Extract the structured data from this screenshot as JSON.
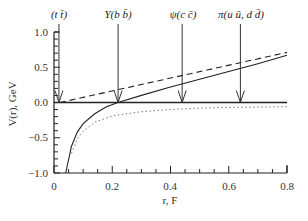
{
  "chart_data": {
    "type": "line",
    "title": "",
    "xlabel": "r, F",
    "ylabel": "V(r), GeV",
    "xlim": [
      0,
      0.8
    ],
    "ylim": [
      -1.0,
      1.0
    ],
    "x_ticks": [
      "0",
      "0.2",
      "0.4",
      "0.6",
      "0.8"
    ],
    "y_ticks": [
      "1.0",
      "0.5",
      "0.0",
      "−0.5",
      "−1.0"
    ],
    "grid": false,
    "legend": null,
    "series": [
      {
        "name": "total potential",
        "style": "solid",
        "x": [
          0.04,
          0.06,
          0.08,
          0.1,
          0.14,
          0.18,
          0.22,
          0.3,
          0.4,
          0.5,
          0.6,
          0.7,
          0.8
        ],
        "y": [
          -1.0,
          -0.62,
          -0.42,
          -0.3,
          -0.16,
          -0.06,
          0.0,
          0.1,
          0.22,
          0.33,
          0.44,
          0.55,
          0.67
        ]
      },
      {
        "name": "linear confining term",
        "style": "dashed",
        "x": [
          0.02,
          0.8
        ],
        "y": [
          0.0,
          0.71
        ]
      },
      {
        "name": "Coulomb-like term",
        "style": "dotted",
        "x": [
          0.06,
          0.08,
          0.1,
          0.14,
          0.2,
          0.3,
          0.4,
          0.5,
          0.6,
          0.7,
          0.8
        ],
        "y": [
          -0.72,
          -0.52,
          -0.41,
          -0.28,
          -0.19,
          -0.13,
          -0.1,
          -0.08,
          -0.07,
          -0.065,
          -0.06
        ]
      },
      {
        "name": "zero line",
        "style": "solid",
        "x": [
          0.0,
          0.8
        ],
        "y": [
          0.0,
          0.0
        ]
      }
    ],
    "annotations": [
      {
        "label": "(t t̄)",
        "x": 0.017,
        "y": 0.0
      },
      {
        "label": "Υ(b b̄)",
        "x": 0.22,
        "y": 0.0
      },
      {
        "label": "ψ(c c̄)",
        "x": 0.44,
        "y": 0.0
      },
      {
        "label": "π(u ū, d d̄)",
        "x": 0.64,
        "y": 0.0
      }
    ]
  },
  "labels": {
    "xlabel": "r, F",
    "ylabel": "V(r), GeV",
    "ann_tt": "(t t̄)",
    "ann_bb": "Υ(b b̄)",
    "ann_cc": "ψ(c c̄)",
    "ann_pi": "π(u ū, d d̄)",
    "xt0": "0",
    "xt1": "0.2",
    "xt2": "0.4",
    "xt3": "0.6",
    "xt4": "0.8",
    "yt0": "1.0",
    "yt1": "0.5",
    "yt2": "0.0",
    "yt3": "−0.5",
    "yt4": "−1.0"
  }
}
